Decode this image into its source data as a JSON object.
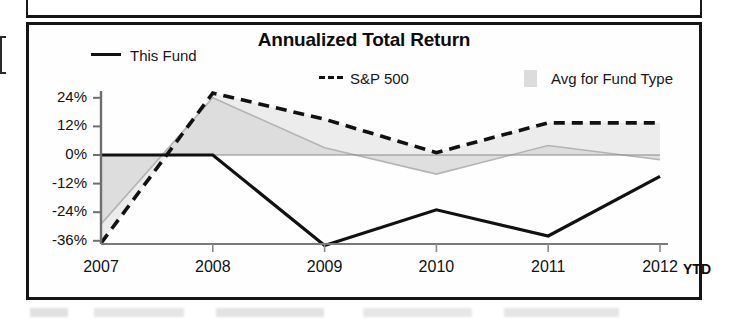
{
  "chart_data": {
    "type": "line",
    "title": "Annualized Total Return",
    "xlabel": "",
    "ylabel": "",
    "categories": [
      "2007",
      "2008",
      "2009",
      "2010",
      "2011",
      "2012"
    ],
    "x_tick_labels": [
      "2007",
      "2008",
      "2009",
      "2010",
      "2011",
      "2012"
    ],
    "x_axis_suffix": "YTD",
    "y_tick_labels": [
      "24%",
      "12%",
      "0%",
      "-12%",
      "-24%",
      "-36%"
    ],
    "y_tick_values": [
      24,
      12,
      0,
      -12,
      -24,
      -36
    ],
    "ylim": [
      -42,
      30
    ],
    "grid": false,
    "legend_position": "top",
    "series": [
      {
        "name": "This Fund",
        "style": "solid",
        "color": "#111111",
        "values": [
          0,
          0,
          -38,
          -23,
          -34,
          -9
        ]
      },
      {
        "name": "S&P 500",
        "style": "dashed",
        "color": "#111111",
        "values": [
          -37,
          26,
          15,
          1,
          13.5,
          13.5
        ]
      },
      {
        "name": "Avg for Fund Type",
        "style": "filled-band",
        "color": "#dcdcdc",
        "values": [
          -29,
          24,
          3,
          -8,
          4,
          -2
        ]
      }
    ]
  },
  "legend": {
    "this_fund": "This Fund",
    "sp500": "S&P 500",
    "avg_fund_type": "Avg for Fund Type"
  },
  "colors": {
    "line": "#111111",
    "band_fill": "#dcdcdc",
    "frame": "#151515",
    "text": "#111111"
  }
}
